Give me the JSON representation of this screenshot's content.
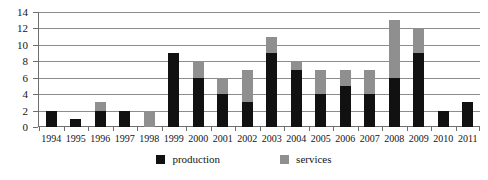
{
  "chart_data": {
    "type": "bar",
    "title": "",
    "subtitle": "",
    "xlabel": "",
    "ylabel": "",
    "stacked": true,
    "grid": true,
    "legend_position": "bottom-center",
    "ylim": [
      0,
      14
    ],
    "yticks": [
      0,
      2,
      4,
      6,
      8,
      10,
      12,
      14
    ],
    "ytick_labels": [
      "0",
      "2",
      "4",
      "6",
      "8",
      "10",
      "12",
      "14"
    ],
    "categories": [
      "1994",
      "1995",
      "1996",
      "1997",
      "1998",
      "1999",
      "2000",
      "2001",
      "2002",
      "2003",
      "2004",
      "2005",
      "2006",
      "2007",
      "2008",
      "2009",
      "2010",
      "2011"
    ],
    "series": [
      {
        "name": "production",
        "color": "#111111",
        "values": [
          2,
          1,
          2,
          2,
          0,
          9,
          6,
          4,
          3,
          9,
          7,
          4,
          5,
          4,
          6,
          9,
          2,
          3
        ]
      },
      {
        "name": "services",
        "color": "#8f8f8f",
        "values": [
          0,
          0,
          1,
          0,
          2,
          0,
          2,
          2,
          4,
          2,
          1,
          3,
          2,
          3,
          7,
          3,
          0,
          0
        ]
      }
    ],
    "totals": [
      2,
      1,
      3,
      2,
      2,
      9,
      8,
      6,
      7,
      11,
      8,
      7,
      7,
      7,
      13,
      12,
      2,
      3
    ]
  },
  "legend": {
    "items": [
      {
        "label": "production",
        "swatch": "production"
      },
      {
        "label": "services",
        "swatch": "services"
      }
    ]
  },
  "colors": {
    "production": "#111111",
    "services": "#8f8f8f",
    "grid": "#8c8c8c",
    "axis": "#6e6e6e",
    "background": "#ffffff"
  }
}
